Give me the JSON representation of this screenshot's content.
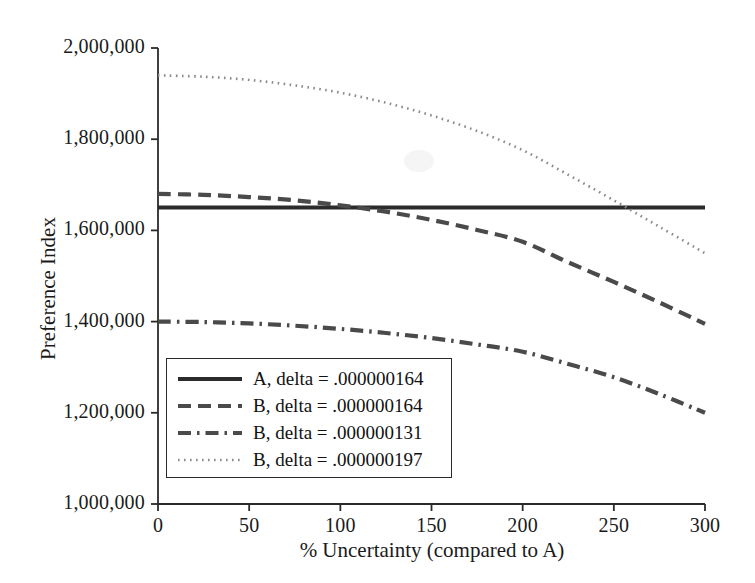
{
  "chart_data": {
    "type": "line",
    "title": "",
    "xlabel": "% Uncertainty (compared to A)",
    "ylabel": "Preference Index",
    "xlim": [
      0,
      300
    ],
    "ylim": [
      1000000,
      2000000
    ],
    "grid": false,
    "legend_position": "lower-left-inside",
    "x_ticks": [
      0,
      50,
      100,
      150,
      200,
      250,
      300
    ],
    "x_tick_labels": [
      "0",
      "50",
      "100",
      "150",
      "200",
      "250",
      "300"
    ],
    "y_ticks": [
      1000000,
      1200000,
      1400000,
      1600000,
      1800000,
      2000000
    ],
    "y_tick_labels": [
      "1,000,000",
      "1,200,000",
      "1,400,000",
      "1,600,000",
      "1,800,000",
      "2,000,000"
    ],
    "x": [
      0,
      25,
      50,
      75,
      100,
      125,
      150,
      175,
      200,
      225,
      250,
      275,
      300
    ],
    "series": [
      {
        "name": "A, delta = .000000164",
        "style": "solid",
        "color": "#2b2b2b",
        "values": [
          1650000,
          1650000,
          1650000,
          1650000,
          1650000,
          1650000,
          1650000,
          1650000,
          1650000,
          1650000,
          1650000,
          1650000,
          1650000
        ]
      },
      {
        "name": "B, delta = .000000164",
        "style": "dashed",
        "color": "#4a4a4a",
        "values": [
          1680000,
          1678000,
          1673000,
          1666000,
          1655000,
          1641000,
          1623000,
          1601000,
          1575000,
          1530000,
          1487000,
          1442000,
          1395000
        ]
      },
      {
        "name": "B, delta = .000000131",
        "style": "dashdot",
        "color": "#4a4a4a",
        "values": [
          1400000,
          1399000,
          1396000,
          1391000,
          1384000,
          1375000,
          1364000,
          1350000,
          1334000,
          1307000,
          1278000,
          1241000,
          1200000
        ]
      },
      {
        "name": "B, delta = .000000197",
        "style": "dotted",
        "color": "#8a8a8a",
        "values": [
          1940000,
          1937000,
          1930000,
          1918000,
          1902000,
          1880000,
          1852000,
          1818000,
          1776000,
          1722000,
          1666000,
          1608000,
          1550000
        ]
      }
    ]
  },
  "axes": {
    "y_title": "Preference Index",
    "x_title": "% Uncertainty (compared to A)"
  },
  "legend": {
    "entries": [
      {
        "label": "A, delta = .000000164",
        "style": "solid"
      },
      {
        "label": "B, delta = .000000164",
        "style": "dashed"
      },
      {
        "label": "B, delta = .000000131",
        "style": "dashdot"
      },
      {
        "label": "B, delta = .000000197",
        "style": "dotted"
      }
    ]
  }
}
